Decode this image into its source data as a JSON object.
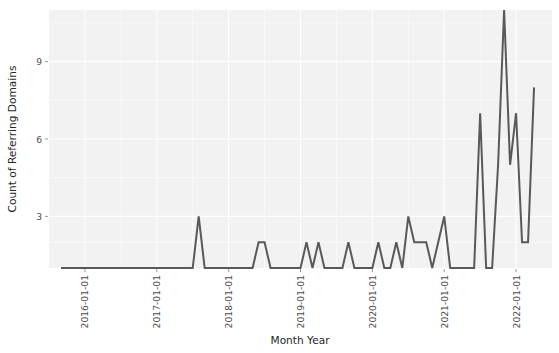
{
  "chart_data": {
    "type": "line",
    "title": "",
    "xlabel": "Month Year",
    "ylabel": "Count of Referring Domains",
    "grid": true,
    "legend": false,
    "line_color": "#595959",
    "panel_color": "#f2f2f2",
    "gridline_color": "#ffffff",
    "xlim": [
      "2015-07-01",
      "2022-07-01"
    ],
    "ylim": [
      1,
      11
    ],
    "yticks": [
      3,
      6,
      9
    ],
    "ytick_labels": [
      "3",
      "6",
      "9"
    ],
    "xticks": [
      "2016-01-01",
      "2017-01-01",
      "2018-01-01",
      "2019-01-01",
      "2020-01-01",
      "2021-01-01",
      "2022-01-01"
    ],
    "xtick_labels": [
      "2016-01-01",
      "2017-01-01",
      "2018-01-01",
      "2019-01-01",
      "2020-01-01",
      "2021-01-01",
      "2022-01-01"
    ],
    "xtick_label_rotation": 90,
    "x": [
      "2015-09-01",
      "2015-10-01",
      "2015-11-01",
      "2015-12-01",
      "2016-01-01",
      "2016-02-01",
      "2016-03-01",
      "2016-04-01",
      "2016-05-01",
      "2016-06-01",
      "2016-07-01",
      "2016-08-01",
      "2016-09-01",
      "2016-10-01",
      "2016-11-01",
      "2016-12-01",
      "2017-01-01",
      "2017-02-01",
      "2017-03-01",
      "2017-04-01",
      "2017-05-01",
      "2017-06-01",
      "2017-07-01",
      "2017-08-01",
      "2017-09-01",
      "2017-10-01",
      "2017-11-01",
      "2017-12-01",
      "2018-01-01",
      "2018-02-01",
      "2018-03-01",
      "2018-04-01",
      "2018-05-01",
      "2018-06-01",
      "2018-07-01",
      "2018-08-01",
      "2018-09-01",
      "2018-10-01",
      "2018-11-01",
      "2018-12-01",
      "2019-01-01",
      "2019-02-01",
      "2019-03-01",
      "2019-04-01",
      "2019-05-01",
      "2019-06-01",
      "2019-07-01",
      "2019-08-01",
      "2019-09-01",
      "2019-10-01",
      "2019-11-01",
      "2019-12-01",
      "2020-01-01",
      "2020-02-01",
      "2020-03-01",
      "2020-04-01",
      "2020-05-01",
      "2020-06-01",
      "2020-07-01",
      "2020-08-01",
      "2020-09-01",
      "2020-10-01",
      "2020-11-01",
      "2020-12-01",
      "2021-01-01",
      "2021-02-01",
      "2021-03-01",
      "2021-04-01",
      "2021-05-01",
      "2021-06-01",
      "2021-07-01",
      "2021-08-01",
      "2021-09-01",
      "2021-10-01",
      "2021-11-01",
      "2021-12-01",
      "2022-01-01",
      "2022-02-01",
      "2022-03-01",
      "2022-04-01"
    ],
    "values": [
      1,
      1,
      1,
      1,
      1,
      1,
      1,
      1,
      1,
      1,
      1,
      1,
      1,
      1,
      1,
      1,
      1,
      1,
      1,
      1,
      1,
      1,
      1,
      3,
      1,
      1,
      1,
      1,
      1,
      1,
      1,
      1,
      1,
      2,
      2,
      1,
      1,
      1,
      1,
      1,
      1,
      2,
      1,
      2,
      1,
      1,
      1,
      1,
      2,
      1,
      1,
      1,
      1,
      2,
      1,
      1,
      2,
      1,
      3,
      2,
      2,
      2,
      1,
      2,
      3,
      1,
      1,
      1,
      1,
      1,
      7,
      1,
      1,
      5,
      11,
      5,
      7,
      2,
      2,
      8
    ],
    "series_name": "Count of Referring Domains"
  }
}
